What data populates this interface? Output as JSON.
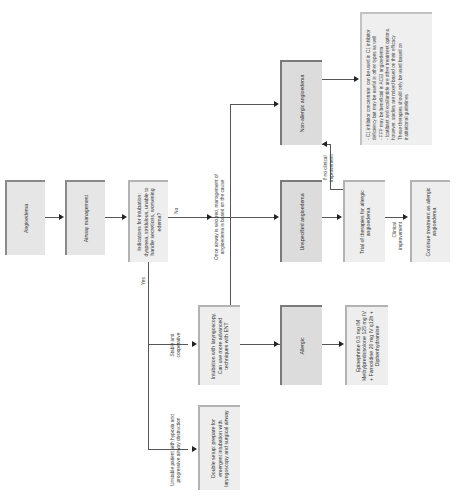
{
  "nodes": {
    "angioedema": "Angioedema",
    "airway_management": "Airway management",
    "indications": "Indications for intubation: dyspnea, stridulous, unable to handle secretions, worsening edema?",
    "non_allergic": "Non-allergic angioedema",
    "unspecified": "Unspecified angioedema",
    "trial": "Trial of therapies for allergic angioedema",
    "continue": "Continue treatment as allergic angioedema",
    "allergic": "Allergic",
    "epinephrine": "Epinephrine 0.5 mg IM Methylprednisolone 125 mg IV + Famotidine 20 mg IV q12h + Diphenhydramine",
    "intubation": "Intubation with laryngoscopy. Can use more advanced techniques with ENT",
    "double_setup": "Double setup: prepare for emergent intubation with laryngoscopy and surgical airway"
  },
  "note": {
    "lines": [
      "- C1 inhibitor concentrate: can be used in C1 inhibitor deficiency but may be useful in other types as well",
      "- FFP may be beneficial in ACEI angioedema",
      "- Icatibant and ecallantide are other treatment options, however, studies are mixed based on their efficacy",
      "These therapies should only be used based on institutional guidelines"
    ]
  },
  "labels": {
    "no": "No",
    "yes": "Yes",
    "once_secured": "Once airway is secured, management of angioedema is based on the cause",
    "no_improvement": "If no clinical improvement",
    "clinical_improvement": "Clinical improvement",
    "stable": "Stable and cooperative",
    "unstable": "Unstable patient with hypoxia and progressive airway obstruction"
  },
  "colors": {
    "box_fill": "#e6e6e6",
    "box_border": "#8a8a8a",
    "line": "#555555"
  }
}
